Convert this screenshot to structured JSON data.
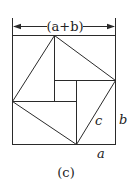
{
  "figure": {
    "caption": "(c)",
    "dimension_label": "(a+b)",
    "labels": {
      "a": "a",
      "b": "b",
      "c": "c"
    },
    "colors": {
      "stroke": "#2a2a2a",
      "background": "#ffffff"
    }
  }
}
